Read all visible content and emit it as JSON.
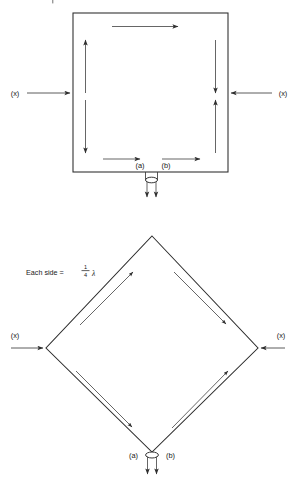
{
  "figure": {
    "background_color": "#ffffff",
    "line_color": "#2b2b2b",
    "arrow_color": "#4a4a4a"
  },
  "diagrams": [
    {
      "id": "square-loop",
      "shape": "square",
      "left_source_label": "(x)",
      "right_source_label": "(x)",
      "feed_terminal_a": "(a)",
      "feed_terminal_b": "(b)",
      "current_flow": "clockwise",
      "arrows": [
        {
          "name": "top-segment-arrow",
          "direction": "right"
        },
        {
          "name": "left-upper-arrow",
          "direction": "up"
        },
        {
          "name": "left-lower-arrow",
          "direction": "down"
        },
        {
          "name": "right-upper-arrow",
          "direction": "down"
        },
        {
          "name": "right-lower-arrow",
          "direction": "up"
        },
        {
          "name": "bottom-left-arrow",
          "direction": "right"
        },
        {
          "name": "bottom-right-arrow",
          "direction": "right"
        },
        {
          "name": "feed-left-arrow",
          "direction": "down"
        },
        {
          "name": "feed-right-arrow",
          "direction": "down"
        }
      ]
    },
    {
      "id": "diamond-loop",
      "shape": "diamond",
      "side_label_prefix": "Each side =",
      "side_fraction_numerator": "1",
      "side_fraction_denominator": "4",
      "side_wavelength_symbol": "λ",
      "left_source_label": "(x)",
      "right_source_label": "(x)",
      "feed_terminal_a": "(a)",
      "feed_terminal_b": "(b)",
      "current_flow": "clockwise",
      "arrows": [
        {
          "name": "upper-left-arrow",
          "direction": "up-right"
        },
        {
          "name": "upper-right-arrow",
          "direction": "down-right"
        },
        {
          "name": "lower-left-arrow",
          "direction": "down-right"
        },
        {
          "name": "lower-right-arrow",
          "direction": "up-right"
        },
        {
          "name": "feed-left-arrow",
          "direction": "down"
        },
        {
          "name": "feed-right-arrow",
          "direction": "down"
        }
      ]
    }
  ]
}
